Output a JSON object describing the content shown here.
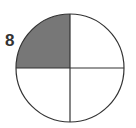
{
  "question_number": "8",
  "figure": {
    "type": "fraction-circle",
    "parts": 4,
    "shaded_parts": 1,
    "shaded_quadrant": "top-left",
    "shade_color": "#777777",
    "line_color": "#333333"
  }
}
